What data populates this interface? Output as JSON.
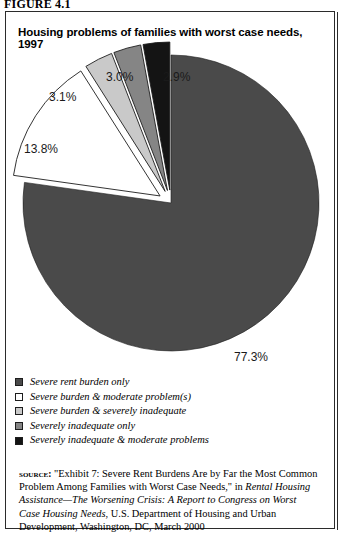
{
  "figure_label": "FIGURE 4.1",
  "chart_title": "Housing problems of families with worst case needs, 1997",
  "chart_data": {
    "type": "pie",
    "title": "Housing problems of families with worst case needs, 1997",
    "categories": [
      "Severe rent burden only",
      "Severe burden & moderate problem(s)",
      "Severe burden & severely inadequate",
      "Severely inadequate only",
      "Severely inadequate & moderate problems"
    ],
    "values": [
      77.3,
      13.8,
      3.1,
      3.0,
      2.9
    ],
    "value_labels": [
      "77.3%",
      "13.8%",
      "3.1%",
      "3.0%",
      "2.9%"
    ],
    "colors": [
      "#4a4a4a",
      "#ffffff",
      "#c9c9c9",
      "#858585",
      "#141414"
    ],
    "exploded": [
      false,
      true,
      true,
      true,
      true
    ],
    "legend_position": "below",
    "units": "percent"
  },
  "legend": {
    "items": [
      {
        "label": "Severe rent burden only",
        "color": "#4a4a4a"
      },
      {
        "label": "Severe burden & moderate problem(s)",
        "color": "#ffffff"
      },
      {
        "label": "Severe burden & severely inadequate",
        "color": "#c9c9c9"
      },
      {
        "label": "Severely inadequate only",
        "color": "#858585"
      },
      {
        "label": "Severely inadequate & moderate problems",
        "color": "#141414"
      }
    ]
  },
  "source": {
    "kicker": "source:",
    "part1": " \"Exhibit 7: Severe Rent Burdens Are by Far the Most Common Problem Among Families with Worst Case Needs,\" in ",
    "italic1": "Rental Housing Assistance—The Worsening Crisis: A Report to Congress on Worst Case Housing Needs",
    "part2": ", U.S. Department of Housing and Urban Development, Washington, DC, March 2000"
  }
}
